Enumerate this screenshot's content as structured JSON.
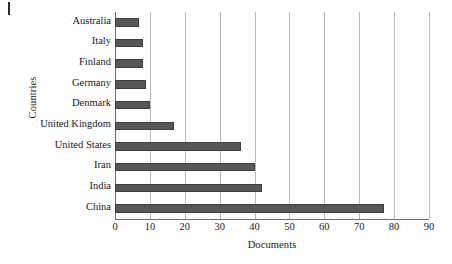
{
  "chart_data": {
    "type": "bar",
    "orientation": "horizontal",
    "title": "",
    "xlabel": "Documents",
    "ylabel": "Countries",
    "categories": [
      "China",
      "India",
      "Iran",
      "United States",
      "United Kingdom",
      "Denmark",
      "Germany",
      "Finland",
      "Italy",
      "Australia"
    ],
    "values": [
      77,
      42,
      40,
      36,
      17,
      10,
      9,
      8,
      8,
      7
    ],
    "xlim": [
      0,
      90
    ],
    "xticks": [
      0,
      10,
      20,
      30,
      40,
      50,
      60,
      70,
      80,
      90
    ],
    "xtick_labels": [
      "0",
      "10",
      "20",
      "30",
      "40",
      "50",
      "60",
      "70",
      "80",
      "90"
    ],
    "grid": "vertical",
    "legend": "none",
    "bar_color": "#575757",
    "bar_edge_color": "#3e3e3e",
    "gridline_color": "#b9b9b9",
    "axis_color": "#6e6e6e"
  }
}
